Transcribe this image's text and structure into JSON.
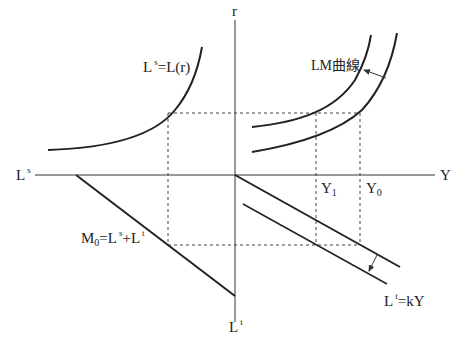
{
  "diagram": {
    "colors": {
      "line": "#222222",
      "dashed": "#444444",
      "background": "#ffffff"
    },
    "axes": {
      "vertical_top_label": "r",
      "vertical_bottom_label_base": "L",
      "vertical_bottom_label_sup": "t",
      "horizontal_left_label_base": "L",
      "horizontal_left_label_sup": "s",
      "horizontal_right_label": "Y"
    },
    "curves": {
      "speculative_demand": {
        "label_base": "L",
        "label_sup": "s",
        "label_rest": "=L(r)"
      },
      "lm_curve": {
        "label": "LM曲線"
      },
      "money_supply": {
        "label_base": "M",
        "label_sub": "0",
        "label_eq": "=L",
        "label_sup1": "s",
        "label_plus": "+L",
        "label_sup2": "t"
      },
      "transaction_demand": {
        "label_base": "L",
        "label_sup": "t",
        "label_rest": "=kY"
      }
    },
    "ticks": {
      "y1_base": "Y",
      "y1_sub": "1",
      "y0_base": "Y",
      "y0_sub": "0"
    }
  }
}
